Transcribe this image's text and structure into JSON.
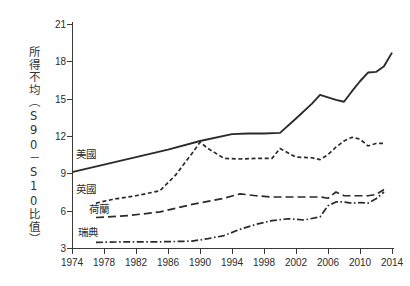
{
  "chart_data": {
    "type": "line",
    "title": "",
    "xlabel": "",
    "ylabel": "所得不均（S90－S10比值）",
    "xlim": [
      1974,
      2014
    ],
    "ylim": [
      3,
      21
    ],
    "yticks": [
      3,
      6,
      9,
      12,
      15,
      18,
      21
    ],
    "xticks": [
      1974,
      1978,
      1982,
      1986,
      1990,
      1994,
      1998,
      2002,
      2006,
      2010,
      2014
    ],
    "grid": false,
    "legend_position": "inline-left",
    "line_color": "#2b2b2b",
    "series": [
      {
        "name": "美國",
        "label": "美國",
        "style": "solid",
        "x": [
          1974,
          1978,
          1982,
          1986,
          1990,
          1994,
          1996,
          1998,
          2000,
          2002,
          2004,
          2005,
          2006,
          2007,
          2008,
          2009,
          2010,
          2011,
          2012,
          2013,
          2014
        ],
        "values": [
          9.1,
          9.7,
          10.3,
          10.9,
          11.6,
          12.15,
          12.2,
          12.2,
          12.25,
          13.4,
          14.6,
          15.3,
          15.1,
          14.9,
          14.75,
          15.6,
          16.4,
          17.1,
          17.15,
          17.6,
          18.7
        ]
      },
      {
        "name": "英國",
        "label": "英國",
        "style": "dashed",
        "x": [
          1977,
          1979,
          1982,
          1985,
          1987,
          1989,
          1990,
          1991,
          1993,
          1995,
          1997,
          1999,
          2000,
          2002,
          2004,
          2005,
          2006,
          2007,
          2008,
          2009,
          2010,
          2011,
          2012,
          2013
        ],
        "values": [
          6.6,
          6.9,
          7.2,
          7.6,
          8.9,
          10.6,
          11.5,
          11.0,
          10.2,
          10.15,
          10.2,
          10.2,
          11.0,
          10.3,
          10.25,
          10.1,
          10.5,
          11.1,
          11.6,
          11.9,
          11.75,
          11.2,
          11.4,
          11.4
        ]
      },
      {
        "name": "荷蘭",
        "label": "荷蘭",
        "style": "longdash",
        "x": [
          1977,
          1981,
          1985,
          1989,
          1993,
          1995,
          1997,
          1999,
          2001,
          2003,
          2005,
          2006,
          2007,
          2008,
          2009,
          2010,
          2011,
          2012,
          2013
        ],
        "values": [
          5.45,
          5.6,
          5.9,
          6.5,
          7.0,
          7.35,
          7.2,
          7.1,
          7.1,
          7.1,
          7.1,
          7.0,
          7.5,
          7.2,
          7.2,
          7.2,
          7.2,
          7.3,
          7.7
        ]
      },
      {
        "name": "瑞典",
        "label": "瑞典",
        "style": "dashdot",
        "x": [
          1977,
          1981,
          1985,
          1989,
          1991,
          1993,
          1995,
          1997,
          1999,
          2001,
          2003,
          2005,
          2006,
          2007,
          2008,
          2009,
          2010,
          2011,
          2012,
          2013
        ],
        "values": [
          3.45,
          3.5,
          3.5,
          3.55,
          3.75,
          4.0,
          4.5,
          4.9,
          5.2,
          5.35,
          5.25,
          5.5,
          6.4,
          6.7,
          6.7,
          6.6,
          6.65,
          6.6,
          6.95,
          7.5
        ]
      }
    ]
  },
  "axis": {
    "y_tick_labels": [
      "3",
      "6",
      "9",
      "12",
      "15",
      "18",
      "21"
    ],
    "x_tick_labels": [
      "1974",
      "1978",
      "1982",
      "1986",
      "1990",
      "1994",
      "1998",
      "2002",
      "2006",
      "2010",
      "2014"
    ],
    "y_title": "所得不均（S90－S10比值）"
  },
  "series_labels": {
    "us": "美國",
    "uk": "英國",
    "netherlands": "荷蘭",
    "sweden": "瑞典"
  }
}
